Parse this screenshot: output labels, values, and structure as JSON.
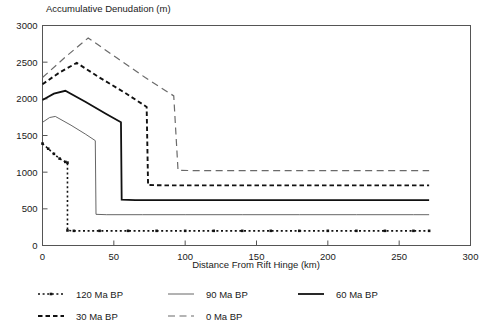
{
  "chart_data": {
    "type": "line",
    "title": "",
    "ylabel": "Accumulative Denudation (m)",
    "xlabel": "Distance From Rift Hinge (km)",
    "xlim": [
      0,
      300
    ],
    "ylim": [
      0,
      3000
    ],
    "xticks": [
      0,
      50,
      100,
      150,
      200,
      250,
      300
    ],
    "yticks": [
      0,
      500,
      1000,
      1500,
      2000,
      2500,
      3000
    ],
    "xtick_labels": [
      "0",
      "50",
      "100",
      "150",
      "200",
      "250",
      "300"
    ],
    "ytick_labels": [
      "0",
      "500",
      "1000",
      "1500",
      "2000",
      "2500",
      "3000"
    ],
    "grid": false,
    "legend_position": "below-plot",
    "series": [
      {
        "name": "120 Ma BP",
        "style": "dotted-markers",
        "color": "#111111",
        "stroke_width": 1.6,
        "dash": "2,2.6",
        "markers": true,
        "x": [
          0,
          4,
          8,
          12,
          16,
          17.5,
          17.5,
          22,
          40,
          60,
          80,
          100,
          120,
          140,
          160,
          180,
          200,
          220,
          240,
          260,
          271
        ],
        "y": [
          1390,
          1320,
          1250,
          1185,
          1140,
          1130,
          205,
          200,
          200,
          200,
          200,
          200,
          200,
          200,
          200,
          200,
          200,
          200,
          200,
          200,
          200
        ]
      },
      {
        "name": "90 Ma BP",
        "style": "thin-solid",
        "color": "#555555",
        "stroke_width": 0.9,
        "dash": "none",
        "markers": false,
        "x": [
          0,
          5,
          9,
          20,
          30,
          37,
          37.5,
          45,
          70,
          100,
          140,
          180,
          220,
          260,
          271
        ],
        "y": [
          1680,
          1745,
          1760,
          1640,
          1520,
          1430,
          425,
          420,
          420,
          420,
          420,
          420,
          420,
          420,
          420
        ]
      },
      {
        "name": "60 Ma BP",
        "style": "thick-solid",
        "color": "#111111",
        "stroke_width": 1.8,
        "dash": "none",
        "markers": false,
        "x": [
          0,
          8,
          16,
          30,
          45,
          55,
          55.5,
          65,
          90,
          120,
          160,
          200,
          240,
          271
        ],
        "y": [
          1985,
          2070,
          2110,
          1960,
          1790,
          1680,
          625,
          620,
          620,
          620,
          620,
          620,
          620,
          620
        ]
      },
      {
        "name": "30 Ma BP",
        "style": "thick-dashed",
        "color": "#111111",
        "stroke_width": 1.9,
        "dash": "4.5,3",
        "markers": false,
        "x": [
          0,
          12,
          24,
          40,
          58,
          73,
          74,
          85,
          110,
          150,
          190,
          230,
          271
        ],
        "y": [
          2200,
          2360,
          2490,
          2290,
          2080,
          1890,
          825,
          820,
          820,
          820,
          820,
          820,
          820
        ]
      },
      {
        "name": "0 Ma BP",
        "style": "long-dashed",
        "color": "#6a6a6a",
        "stroke_width": 1.2,
        "dash": "7,4.5",
        "markers": false,
        "x": [
          0,
          16,
          32,
          52,
          72,
          92,
          95,
          110,
          140,
          180,
          220,
          260,
          271
        ],
        "y": [
          2290,
          2570,
          2830,
          2560,
          2290,
          2040,
          1025,
          1020,
          1020,
          1020,
          1020,
          1020,
          1020
        ]
      }
    ]
  },
  "legend": {
    "entries": [
      {
        "label": "120 Ma BP",
        "series_index": 0
      },
      {
        "label": "90 Ma BP",
        "series_index": 1
      },
      {
        "label": "60 Ma BP",
        "series_index": 2
      },
      {
        "label": "30 Ma BP",
        "series_index": 3
      },
      {
        "label": "0 Ma BP",
        "series_index": 4
      }
    ]
  }
}
